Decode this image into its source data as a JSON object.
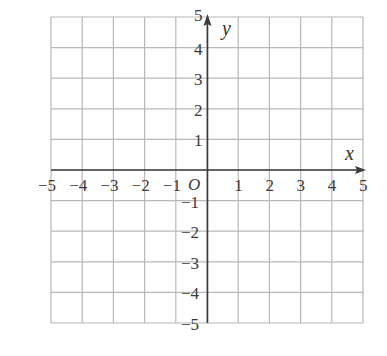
{
  "diagram": {
    "type": "coordinate-plane",
    "x_axis": {
      "label": "x",
      "min": -5,
      "max": 5,
      "tick_labels": [
        "−5",
        "−4",
        "−3",
        "−2",
        "−1",
        "1",
        "2",
        "3",
        "4",
        "5"
      ]
    },
    "y_axis": {
      "label": "y",
      "min": -5,
      "max": 5,
      "tick_labels_positive": [
        "1",
        "2",
        "3",
        "4",
        "5"
      ],
      "tick_labels_negative": [
        "−1",
        "−2",
        "−3",
        "−4",
        "−5"
      ]
    },
    "origin_label": "O",
    "grid": {
      "rows": 10,
      "cols": 10,
      "step": 1
    },
    "colors": {
      "grid": "#b8b8b8",
      "axis": "#3c3c3c",
      "text": "#3a3a3a",
      "background": "#ffffff"
    }
  }
}
